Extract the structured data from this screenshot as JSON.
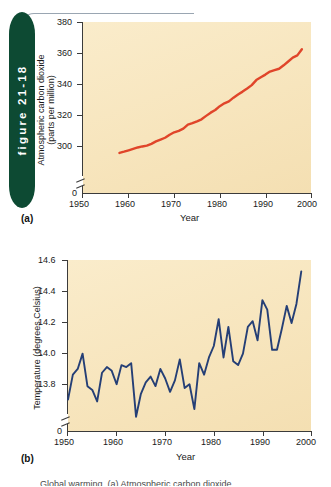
{
  "figure": {
    "tab_label": "figure 21-18",
    "tab_color": "#0d4a33"
  },
  "panel_a": {
    "letter": "(a)",
    "ylabel_line1": "Atmospheric carbon dioxide",
    "ylabel_line2": "(parts per million)",
    "xlabel": "Year",
    "y_ticks": [
      "380",
      "360",
      "340",
      "320",
      "300",
      "0"
    ],
    "x_ticks": [
      "1950",
      "1960",
      "1970",
      "1980",
      "1990",
      "2000"
    ]
  },
  "panel_b": {
    "letter": "(b)",
    "ylabel": "Temperature (degrees Celsius)",
    "xlabel": "Year",
    "y_ticks": [
      "14.6",
      "14.4",
      "14.2",
      "14.0",
      "13.8",
      "0"
    ],
    "x_ticks": [
      "1950",
      "1960",
      "1970",
      "1980",
      "1990",
      "2000"
    ]
  },
  "caption": {
    "clipped_text": "Global warming. (a) Atmospheric carbon dioxide"
  },
  "chart_data": [
    {
      "type": "line",
      "id": "co2",
      "title": "",
      "xlabel": "Year",
      "ylabel": "Atmospheric carbon dioxide (parts per million)",
      "xlim": [
        1950,
        2000
      ],
      "ylim": [
        295,
        380
      ],
      "yticks": [
        300,
        320,
        340,
        360,
        380
      ],
      "xticks": [
        1950,
        1960,
        1970,
        1980,
        1990,
        2000
      ],
      "axis_break": true,
      "axis_break_note": "y axis broken between 0 and 300",
      "grid": false,
      "legend": "none",
      "color": "#e0452a",
      "x": [
        1958,
        1959,
        1960,
        1961,
        1962,
        1963,
        1964,
        1965,
        1966,
        1967,
        1968,
        1969,
        1970,
        1971,
        1972,
        1973,
        1974,
        1975,
        1976,
        1977,
        1978,
        1979,
        1980,
        1981,
        1982,
        1983,
        1984,
        1985,
        1986,
        1987,
        1988,
        1989,
        1990,
        1991,
        1992,
        1993,
        1994,
        1995,
        1996,
        1997,
        1998
      ],
      "values": [
        315.3,
        315.9,
        316.6,
        317.3,
        318.0,
        318.5,
        318.9,
        319.8,
        321.0,
        321.9,
        322.8,
        324.3,
        325.5,
        326.2,
        327.3,
        329.3,
        330.0,
        330.9,
        331.9,
        333.6,
        335.2,
        336.5,
        338.4,
        339.8,
        340.8,
        342.6,
        344.2,
        345.6,
        347.1,
        348.8,
        351.3,
        352.7,
        354.0,
        355.5,
        356.2,
        356.9,
        358.6,
        360.5,
        362.4,
        363.5,
        366.5
      ]
    },
    {
      "type": "line",
      "id": "temperature",
      "title": "",
      "xlabel": "Year",
      "ylabel": "Temperature (degrees Celsius)",
      "xlim": [
        1950,
        2000
      ],
      "ylim": [
        13.7,
        14.6
      ],
      "yticks": [
        13.8,
        14.0,
        14.2,
        14.4,
        14.6
      ],
      "xticks": [
        1950,
        1960,
        1970,
        1980,
        1990,
        2000
      ],
      "axis_break": true,
      "axis_break_note": "y axis broken between 0 and 13.8",
      "grid": false,
      "legend": "none",
      "color": "#253f76",
      "x": [
        1950,
        1951,
        1952,
        1953,
        1954,
        1955,
        1956,
        1957,
        1958,
        1959,
        1960,
        1961,
        1962,
        1963,
        1964,
        1965,
        1966,
        1967,
        1968,
        1969,
        1970,
        1971,
        1972,
        1973,
        1974,
        1975,
        1976,
        1977,
        1978,
        1979,
        1980,
        1981,
        1982,
        1983,
        1984,
        1985,
        1986,
        1987,
        1988,
        1989,
        1990,
        1991,
        1992,
        1993,
        1994,
        1995,
        1996,
        1997,
        1998
      ],
      "values": [
        13.87,
        14.0,
        14.03,
        14.11,
        13.94,
        13.92,
        13.86,
        14.01,
        14.04,
        14.02,
        13.95,
        14.05,
        14.04,
        14.06,
        13.78,
        13.9,
        13.96,
        13.99,
        13.94,
        14.03,
        13.98,
        13.91,
        13.97,
        14.08,
        13.93,
        13.95,
        13.82,
        14.06,
        14.0,
        14.09,
        14.15,
        14.29,
        14.09,
        14.25,
        14.07,
        14.05,
        14.11,
        14.25,
        14.28,
        14.18,
        14.39,
        14.34,
        14.13,
        14.13,
        14.24,
        14.36,
        14.27,
        14.37,
        14.54
      ]
    }
  ]
}
